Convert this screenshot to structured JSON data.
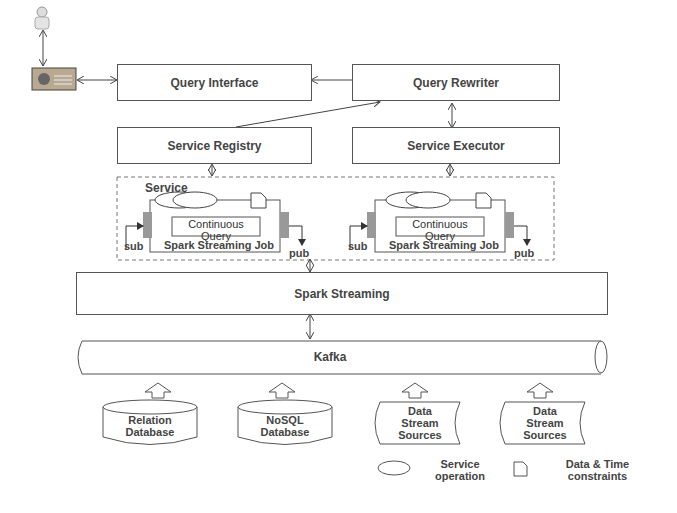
{
  "diagram": {
    "components": {
      "query_interface": "Query Interface",
      "query_rewriter": "Query Rewriter",
      "service_registry": "Service Registry",
      "service_executor": "Service Executor",
      "spark_streaming": "Spark Streaming",
      "kafka": "Kafka"
    },
    "services": [
      {
        "title": "Service",
        "query_label": "Continuous Query",
        "job_label": "Spark Streaming Job",
        "sub": "sub",
        "pub": "pub"
      },
      {
        "title": "",
        "query_label": "Continuous Query",
        "job_label": "Spark Streaming Job",
        "sub": "sub",
        "pub": "pub"
      }
    ],
    "sources": [
      {
        "type": "database",
        "label_line1": "Relation",
        "label_line2": "Database"
      },
      {
        "type": "database",
        "label_line1": "NoSQL",
        "label_line2": "Database"
      },
      {
        "type": "stream",
        "label_line1": "Data",
        "label_line2": "Stream",
        "label_line3": "Sources"
      },
      {
        "type": "stream",
        "label_line1": "Data",
        "label_line2": "Stream",
        "label_line3": "Sources"
      }
    ],
    "legend": [
      {
        "icon": "ellipse-icon",
        "line1": "Service",
        "line2": "operation"
      },
      {
        "icon": "document-icon",
        "line1": "Data & Time",
        "line2": "constraints"
      }
    ]
  }
}
